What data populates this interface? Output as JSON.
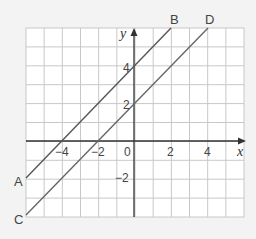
{
  "chart_data": {
    "type": "line",
    "title": "",
    "xlabel": "x",
    "ylabel": "y",
    "xlim": [
      -6,
      6
    ],
    "ylim": [
      -4,
      6
    ],
    "grid": true,
    "xticks": [
      -4,
      -2,
      0,
      2,
      4
    ],
    "yticks": [
      -2,
      2,
      4
    ],
    "series": [
      {
        "name": "AB",
        "start_label": "A",
        "end_label": "B",
        "equation": "y = x + 4",
        "points": [
          [
            -6,
            -2
          ],
          [
            2,
            6
          ]
        ]
      },
      {
        "name": "CD",
        "start_label": "C",
        "end_label": "D",
        "equation": "y = x + 2",
        "points": [
          [
            -6,
            -4
          ],
          [
            4,
            6
          ]
        ]
      }
    ]
  },
  "labels": {
    "x_axis": "x",
    "y_axis": "y",
    "origin": "0",
    "A": "A",
    "B": "B",
    "C": "C",
    "D": "D",
    "tick_x": [
      "−4",
      "−2",
      "2",
      "4"
    ],
    "tick_y": [
      "4",
      "2",
      "−2"
    ]
  },
  "colors": {
    "grid": "#c8c8c8",
    "axis": "#333333",
    "line": "#555555",
    "background": "#ffffff"
  }
}
